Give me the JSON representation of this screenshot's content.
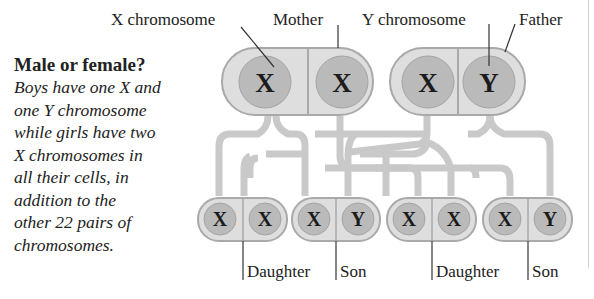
{
  "caption": {
    "title": "Male or female?",
    "body": "Boys have one X and one Y chromosome while girls have two X chromosomes in all their cells, in addition to the other 22 pairs of chromosomes.",
    "lines": [
      "Boys have one X and",
      "one Y chromosome",
      "while girls have two",
      "X chromosomes in",
      "all their cells, in",
      "addition to the",
      "other 22 pairs of",
      "chromosomes."
    ]
  },
  "labels": {
    "x_chromosome": "X chromosome",
    "mother": "Mother",
    "y_chromosome": "Y chromosome",
    "father": "Father"
  },
  "parents": [
    {
      "name": "Mother",
      "chromosomes": [
        "X",
        "X"
      ]
    },
    {
      "name": "Father",
      "chromosomes": [
        "X",
        "Y"
      ]
    }
  ],
  "children": [
    {
      "label": "Daughter",
      "chromosomes": [
        "X",
        "X"
      ]
    },
    {
      "label": "Son",
      "chromosomes": [
        "X",
        "Y"
      ]
    },
    {
      "label": "Daughter",
      "chromosomes": [
        "X",
        "X"
      ]
    },
    {
      "label": "Son",
      "chromosomes": [
        "X",
        "Y"
      ]
    }
  ],
  "colors": {
    "cell_fill": "#dedede",
    "cell_border": "#a9a9a9",
    "chromosome_fill": "#bababa",
    "inheritance_line": "#c9c9c9",
    "text": "#222222"
  }
}
